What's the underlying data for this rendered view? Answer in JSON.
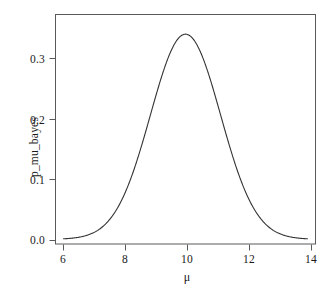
{
  "chart_data": {
    "type": "line",
    "title": "",
    "subtitle": "",
    "xlabel": "μ",
    "ylabel": "p_mu_bayes",
    "xlim": [
      5.72,
      14.28
    ],
    "ylim": [
      -0.008,
      0.381
    ],
    "grid": false,
    "legend": null,
    "xticks": [
      6,
      8,
      10,
      12,
      14
    ],
    "xtick_labels": [
      "6",
      "8",
      "10",
      "12",
      "14"
    ],
    "yticks": [
      0.0,
      0.1,
      0.2,
      0.3
    ],
    "ytick_labels": [
      "0.0",
      "0.1",
      "0.2",
      "0.3"
    ],
    "curve_description": "Gaussian posterior density, mean 10, sd approx 1.15, peak approx 0.347",
    "distribution": {
      "mean": 10.0,
      "sd": 1.15,
      "peak_value": 0.3468
    },
    "line_color": "#333333",
    "line_width": 1.1,
    "series": [
      {
        "name": "p_mu_bayes",
        "x": [
          6.0,
          6.2,
          6.4,
          6.6,
          6.8,
          7.0,
          7.2,
          7.4,
          7.6,
          7.8,
          8.0,
          8.2,
          8.4,
          8.6,
          8.8,
          9.0,
          9.2,
          9.4,
          9.6,
          9.8,
          10.0,
          10.2,
          10.4,
          10.6,
          10.8,
          11.0,
          11.2,
          11.4,
          11.6,
          11.8,
          12.0,
          12.2,
          12.4,
          12.6,
          12.8,
          13.0,
          13.2,
          13.4,
          13.6,
          13.8,
          14.0
        ],
        "y": [
          0.0007,
          0.0014,
          0.0028,
          0.0052,
          0.0093,
          0.0159,
          0.0262,
          0.0414,
          0.0629,
          0.0919,
          0.1291,
          0.1744,
          0.2266,
          0.2831,
          0.3401,
          0.3929,
          0.4364,
          0.4661,
          0.4788,
          0.4729,
          0.4486,
          0.408,
          0.355,
          0.297,
          0.2386,
          0.1843,
          0.1368,
          0.0975,
          0.0668,
          0.044,
          0.0278,
          0.0169,
          0.0099,
          0.0056,
          0.003,
          0.0015,
          0.0008,
          0.0004,
          0.0002,
          0.0001,
          0.0
        ]
      }
    ],
    "axes_color": "#555555",
    "background_color": "#ffffff"
  },
  "figure": {
    "frame": {
      "left": 55,
      "top": 14,
      "right": 316,
      "bottom": 244
    }
  }
}
